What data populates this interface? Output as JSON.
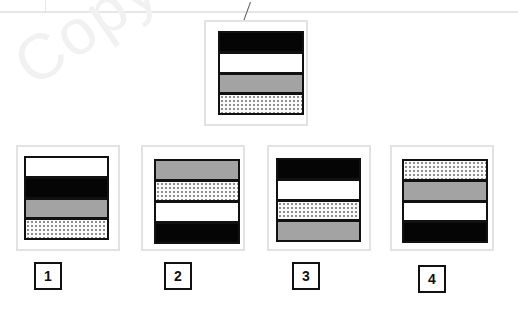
{
  "puzzle": {
    "watermark": "Copyright",
    "reference": {
      "stripes": [
        "black",
        "white",
        "gray",
        "dotted"
      ]
    },
    "options": [
      {
        "label": "1",
        "stripes": [
          "white",
          "black",
          "gray",
          "dotted"
        ]
      },
      {
        "label": "2",
        "stripes": [
          "gray",
          "dotted",
          "white",
          "black"
        ]
      },
      {
        "label": "3",
        "stripes": [
          "black",
          "white",
          "dotted",
          "gray"
        ]
      },
      {
        "label": "4",
        "stripes": [
          "dotted",
          "gray",
          "white",
          "black"
        ]
      }
    ]
  },
  "colors": {
    "black": "#050505",
    "white": "#ffffff",
    "gray": "#a3a3a3",
    "dotted": "#fafafa",
    "panel_border": "#e2e2e2",
    "stripe_border": "#111111"
  }
}
